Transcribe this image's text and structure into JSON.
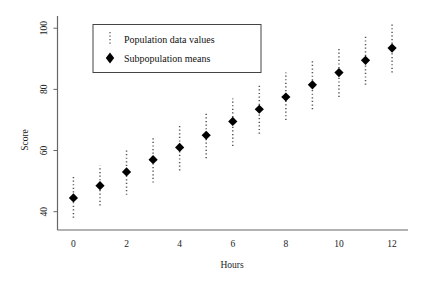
{
  "chart_data": {
    "type": "scatter",
    "title": "",
    "xlabel": "Hours",
    "ylabel": "Score",
    "xlim": [
      -0.6,
      12.6
    ],
    "ylim": [
      34,
      104
    ],
    "xticks": [
      0,
      2,
      4,
      6,
      8,
      10,
      12
    ],
    "yticks": [
      40,
      60,
      80,
      100
    ],
    "grid": false,
    "legend_position": "top-left",
    "x": [
      0,
      1,
      2,
      3,
      4,
      5,
      6,
      7,
      8,
      9,
      10,
      11,
      12
    ],
    "series": [
      {
        "name": "Subpopulation means",
        "marker": "diamond",
        "values": [
          44.5,
          48.5,
          53.0,
          57.0,
          61.0,
          65.0,
          69.5,
          73.5,
          77.5,
          81.5,
          85.5,
          89.5,
          93.5
        ]
      },
      {
        "name": "Population data values",
        "marker": "dotted-vertical-line",
        "spread_low": [
          38.0,
          42.0,
          45.5,
          49.5,
          53.5,
          57.5,
          61.5,
          65.5,
          70.0,
          73.5,
          77.5,
          81.5,
          85.5
        ],
        "spread_high": [
          51.5,
          55.0,
          60.0,
          64.5,
          68.5,
          72.5,
          77.0,
          81.5,
          85.5,
          89.5,
          93.5,
          97.5,
          101.5
        ]
      }
    ],
    "legend": [
      {
        "label": "Population data values",
        "marker": "dotted-vertical-line"
      },
      {
        "label": "Subpopulation means",
        "marker": "diamond"
      }
    ],
    "colors": {
      "marker": "#000000",
      "spread": "#555555",
      "axis": "#555555",
      "text": "#111111",
      "background": "#ffffff"
    }
  },
  "axes": {
    "y_title": "Score",
    "x_title": "Hours",
    "y_tick_labels": [
      "40",
      "60",
      "80",
      "100"
    ],
    "x_tick_labels": [
      "0",
      "2",
      "4",
      "6",
      "8",
      "10",
      "12"
    ]
  },
  "legend": {
    "item_1_label": "Population data values",
    "item_2_label": "Subpopulation means"
  }
}
